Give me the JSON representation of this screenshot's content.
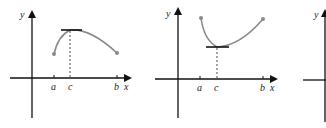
{
  "figure": {
    "colors": {
      "axis": "#111111",
      "curve": "#8a8a8a",
      "tangent": "#111111",
      "dashed": "#333333",
      "dot": "#8a8a8a"
    },
    "graphs": [
      {
        "id": "graph-1",
        "y_label": "y",
        "x_label": "x",
        "ticks": [
          "a",
          "c",
          "b"
        ],
        "feature": "maximum at c with horizontal tangent"
      },
      {
        "id": "graph-2",
        "y_label": "y",
        "x_label": "x",
        "ticks": [
          "a",
          "c",
          "b"
        ],
        "feature": "minimum at c with horizontal tangent"
      },
      {
        "id": "graph-3",
        "y_label": "y",
        "feature": "partially visible"
      }
    ]
  }
}
